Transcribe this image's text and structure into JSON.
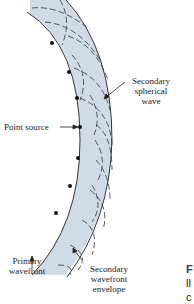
{
  "diagram": {
    "type": "huygens-principle",
    "band_color": "#cfdbe6",
    "line_color": "#333333",
    "labels": {
      "secondary_spherical_wave": [
        "Secondary",
        "spherical",
        "wave"
      ],
      "point_source": "Point source",
      "primary_wavefront": [
        "Primary",
        "wavefront"
      ],
      "secondary_wavefront_envelope": [
        "Secondary",
        "wavefront",
        "envelope"
      ]
    }
  },
  "caption_fragment": {
    "line1": "F",
    "line2": "ll",
    "line3": "c",
    "accent_color": "#1f3a8a"
  }
}
